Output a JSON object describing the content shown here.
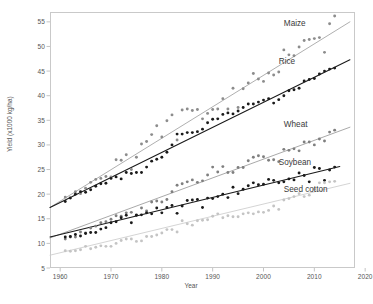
{
  "chart_data": {
    "type": "scatter",
    "title": "",
    "xlabel": "Year",
    "ylabel": "Yield (x1000 kg/ha)",
    "xlim": [
      1958,
      2018
    ],
    "ylim": [
      5,
      57
    ],
    "grid": false,
    "legend_position": "inline-right",
    "x_ticks": [
      "1960",
      "1970",
      "1980",
      "1990",
      "2000",
      "2010",
      "2020"
    ],
    "x_tick_values": [
      1960,
      1970,
      1980,
      1990,
      2000,
      2010,
      2020
    ],
    "y_ticks": [
      "5",
      "10",
      "15",
      "20",
      "25",
      "30",
      "35",
      "40",
      "45",
      "50",
      "55"
    ],
    "y_tick_values": [
      5,
      10,
      15,
      20,
      25,
      30,
      35,
      40,
      45,
      50,
      55
    ],
    "x": [
      1961,
      1962,
      1963,
      1964,
      1965,
      1966,
      1967,
      1968,
      1969,
      1970,
      1971,
      1972,
      1973,
      1974,
      1975,
      1976,
      1977,
      1978,
      1979,
      1980,
      1981,
      1982,
      1983,
      1984,
      1985,
      1986,
      1987,
      1988,
      1989,
      1990,
      1991,
      1992,
      1993,
      1994,
      1995,
      1996,
      1997,
      1998,
      1999,
      2000,
      2001,
      2002,
      2003,
      2004,
      2005,
      2006,
      2007,
      2008,
      2009,
      2010,
      2011,
      2012,
      2013,
      2014
    ],
    "series": [
      {
        "name": "Maize",
        "color": "#8c8c8c",
        "line_color": "#a0a0a0",
        "label": "Maize",
        "label_x": 2004,
        "label_y": 54.2,
        "trend_start": [
          1958,
          17.3
        ],
        "trend_end": [
          2017,
          55.0
        ],
        "values": [
          19.4,
          19.3,
          20.5,
          20.1,
          21.2,
          22.4,
          23.0,
          23.2,
          23.6,
          23.5,
          27.0,
          26.9,
          28.0,
          25.0,
          27.5,
          30.2,
          30.7,
          32.1,
          33.9,
          31.6,
          34.9,
          36.1,
          31.0,
          37.1,
          37.3,
          37.0,
          37.2,
          35.3,
          36.4,
          37.2,
          37.3,
          39.4,
          37.3,
          41.5,
          37.6,
          41.4,
          42.6,
          44.5,
          43.4,
          42.9,
          44.6,
          44.2,
          44.8,
          49.3,
          48.3,
          48.1,
          49.9,
          51.2,
          51.4,
          51.6,
          51.8,
          48.8,
          54.6,
          56.2
        ]
      },
      {
        "name": "Rice",
        "color": "#1a1a1a",
        "line_color": "#1a1a1a",
        "label": "Rice",
        "label_x": 2003,
        "label_y": 46.5,
        "trend_start": [
          1958,
          17.3
        ],
        "trend_end": [
          2017,
          47.3
        ],
        "values": [
          18.5,
          19.2,
          20.0,
          20.5,
          20.4,
          20.9,
          21.6,
          22.1,
          22.2,
          23.2,
          23.5,
          23.1,
          24.4,
          24.2,
          24.4,
          24.4,
          25.5,
          26.7,
          27.1,
          27.5,
          28.5,
          30.0,
          32.2,
          32.2,
          32.5,
          32.5,
          32.7,
          33.2,
          34.5,
          35.2,
          35.3,
          36.2,
          36.5,
          36.3,
          36.9,
          37.6,
          38.3,
          38.3,
          38.7,
          39.1,
          39.4,
          38.5,
          39.2,
          40.0,
          41.0,
          41.2,
          41.5,
          43.0,
          43.3,
          43.5,
          44.4,
          45.0,
          45.4,
          45.6
        ]
      },
      {
        "name": "Wheat",
        "color": "#7f7f7f",
        "line_color": "#9a9a9a",
        "label": "Wheat",
        "label_x": 2004,
        "label_y": 33.6,
        "trend_start": [
          1958,
          11.1
        ],
        "trend_end": [
          2017,
          33.6
        ],
        "values": [
          10.9,
          11.3,
          11.3,
          12.3,
          12.1,
          13.1,
          13.5,
          14.2,
          14.4,
          14.9,
          15.6,
          15.5,
          16.2,
          16.3,
          15.8,
          17.2,
          16.6,
          18.4,
          18.6,
          18.4,
          18.9,
          20.5,
          21.8,
          22.1,
          22.5,
          22.9,
          22.4,
          22.7,
          23.9,
          25.5,
          24.5,
          25.6,
          24.4,
          24.4,
          25.4,
          25.4,
          26.8,
          27.5,
          27.8,
          27.6,
          26.9,
          27.0,
          26.6,
          29.1,
          28.9,
          29.2,
          28.8,
          30.6,
          30.6,
          30.0,
          31.2,
          30.8,
          32.6,
          33.0
        ]
      },
      {
        "name": "Soybean",
        "color": "#1a1a1a",
        "line_color": "#1a1a1a",
        "label": "Soybean",
        "label_x": 2003,
        "label_y": 26.0,
        "trend_start": [
          1958,
          11.3
        ],
        "trend_end": [
          2015,
          25.6
        ],
        "values": [
          11.3,
          11.4,
          11.8,
          11.5,
          12.0,
          12.2,
          12.2,
          12.9,
          13.2,
          14.2,
          14.4,
          15.2,
          15.7,
          14.2,
          15.7,
          15.8,
          16.2,
          16.0,
          17.2,
          16.2,
          17.3,
          17.7,
          16.1,
          17.6,
          18.7,
          18.8,
          18.9,
          17.3,
          19.2,
          19.1,
          19.5,
          20.0,
          19.3,
          21.4,
          20.1,
          21.0,
          21.7,
          22.3,
          21.9,
          22.0,
          23.0,
          22.8,
          22.3,
          22.5,
          23.1,
          22.9,
          24.3,
          23.8,
          22.5,
          25.4,
          25.2,
          22.8,
          24.9,
          25.5
        ]
      },
      {
        "name": "Seed cotton",
        "color": "#c4c4c4",
        "line_color": "#cccccc",
        "label": "Seed cotton",
        "label_x": 2004,
        "label_y": 20.4,
        "trend_start": [
          1958,
          7.6
        ],
        "trend_end": [
          2017,
          22.2
        ],
        "values": [
          8.5,
          8.4,
          8.5,
          8.7,
          9.4,
          8.9,
          9.2,
          9.5,
          9.4,
          9.4,
          10.0,
          10.6,
          10.9,
          10.9,
          10.4,
          10.5,
          11.4,
          11.4,
          11.7,
          12.1,
          12.8,
          12.8,
          12.3,
          14.6,
          14.0,
          13.7,
          14.6,
          14.7,
          14.8,
          15.5,
          16.0,
          15.2,
          15.6,
          15.4,
          15.4,
          16.0,
          16.2,
          16.0,
          16.4,
          16.3,
          16.7,
          17.6,
          16.9,
          18.8,
          19.1,
          19.5,
          20.1,
          19.5,
          19.8,
          21.0,
          22.3,
          22.3,
          22.5,
          22.6
        ]
      }
    ]
  }
}
